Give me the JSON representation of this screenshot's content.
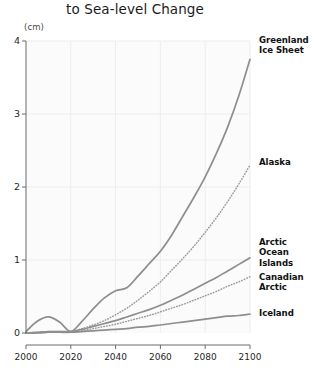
{
  "header": {
    "title": "to Sea-level Change"
  },
  "axes": {
    "y_unit_label": "(cm)",
    "y_ticks": [
      "0",
      "1",
      "2",
      "3",
      "4"
    ],
    "x_ticks": [
      "2000",
      "2020",
      "2040",
      "2060",
      "2080",
      "2100"
    ]
  },
  "labels": {
    "greenland": "Greenland\nIce Sheet",
    "alaska": "Alaska",
    "arctic_ocean_islands": "Arctic\nOcean\nIslands",
    "canadian_arctic": "Canadian\nArctic",
    "iceland": "Iceland"
  },
  "colors": {
    "line": "#8e8e8e",
    "line_dotted": "#9a9a9a",
    "axis": "#6b6b6b",
    "grid": "#ededed",
    "plot_bg": "#fbfbfb",
    "text": "#111111"
  },
  "chart_data": {
    "type": "line",
    "title": "to Sea-level Change",
    "xlabel": "",
    "ylabel": "(cm)",
    "xlim": [
      2000,
      2100
    ],
    "ylim": [
      0,
      4
    ],
    "grid": true,
    "legend_position": "right-inline",
    "x": [
      2000,
      2005,
      2010,
      2015,
      2020,
      2025,
      2030,
      2035,
      2040,
      2045,
      2050,
      2055,
      2060,
      2065,
      2070,
      2075,
      2080,
      2085,
      2090,
      2095,
      2100
    ],
    "series": [
      {
        "name": "Greenland Ice Sheet",
        "style": "solid",
        "values": [
          0.02,
          0.16,
          0.22,
          0.15,
          0.02,
          0.16,
          0.33,
          0.48,
          0.58,
          0.62,
          0.78,
          0.95,
          1.12,
          1.34,
          1.6,
          1.86,
          2.14,
          2.46,
          2.82,
          3.25,
          3.75
        ]
      },
      {
        "name": "Alaska",
        "style": "dotted",
        "values": [
          0.0,
          0.01,
          0.02,
          0.02,
          0.02,
          0.06,
          0.11,
          0.17,
          0.25,
          0.34,
          0.45,
          0.57,
          0.7,
          0.86,
          1.02,
          1.19,
          1.38,
          1.58,
          1.8,
          2.04,
          2.3
        ]
      },
      {
        "name": "Arctic Ocean Islands",
        "style": "solid",
        "values": [
          0.0,
          0.01,
          0.02,
          0.02,
          0.02,
          0.05,
          0.09,
          0.13,
          0.17,
          0.22,
          0.27,
          0.32,
          0.38,
          0.45,
          0.52,
          0.6,
          0.68,
          0.76,
          0.85,
          0.94,
          1.03
        ]
      },
      {
        "name": "Canadian Arctic",
        "style": "dotted",
        "values": [
          0.0,
          0.0,
          0.01,
          0.01,
          0.01,
          0.03,
          0.06,
          0.09,
          0.12,
          0.16,
          0.2,
          0.24,
          0.29,
          0.34,
          0.39,
          0.45,
          0.51,
          0.57,
          0.64,
          0.7,
          0.77
        ]
      },
      {
        "name": "Iceland",
        "style": "solid",
        "values": [
          0.0,
          0.0,
          0.01,
          0.01,
          0.01,
          0.02,
          0.03,
          0.04,
          0.05,
          0.06,
          0.08,
          0.09,
          0.11,
          0.13,
          0.15,
          0.17,
          0.19,
          0.21,
          0.23,
          0.24,
          0.26
        ]
      }
    ]
  }
}
